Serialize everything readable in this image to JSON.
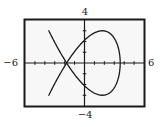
{
  "chart_data": {
    "type": "line",
    "title": "",
    "xlabel": "",
    "ylabel": "",
    "xlim": [
      -6,
      6
    ],
    "ylim": [
      -4,
      4
    ],
    "x_tick_step": 1,
    "y_tick_step": 1,
    "grid": false,
    "legend": "none",
    "axis_labels": {
      "xmin": "−6",
      "xmax": "6",
      "ymax": "4",
      "ymin": "−4"
    },
    "series": [
      {
        "name": "parametric-curve",
        "kind": "parametric",
        "x_expr": "3.6*cos(2t)",
        "y_expr": "3*sin(3t)",
        "x_amplitude": 3.6,
        "y_amplitude": 3,
        "x_frequency": 2,
        "y_frequency": 3,
        "t_range": [
          0,
          6.2832
        ],
        "color": "#1a1a1a"
      }
    ],
    "frame_color": "#1a1a1a",
    "background": "#f7f7f7"
  }
}
